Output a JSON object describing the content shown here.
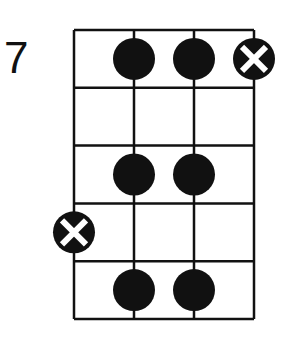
{
  "diagram": {
    "type": "bass-fretboard",
    "start_fret_label": "7",
    "strings": 4,
    "frets": 5,
    "grid": {
      "left": 74,
      "right": 254,
      "top": 30,
      "bottom": 319
    },
    "colors": {
      "line": "#111111",
      "dot": "#111111",
      "background": "#ffffff",
      "x_mark": "#ffffff"
    },
    "notes": [
      {
        "fret": 1,
        "string": 2,
        "type": "dot"
      },
      {
        "fret": 1,
        "string": 3,
        "type": "dot"
      },
      {
        "fret": 1,
        "string": 4,
        "type": "x-dot"
      },
      {
        "fret": 3,
        "string": 2,
        "type": "dot"
      },
      {
        "fret": 3,
        "string": 3,
        "type": "dot"
      },
      {
        "fret": 4,
        "string": 1,
        "type": "x-dot"
      },
      {
        "fret": 5,
        "string": 2,
        "type": "dot"
      },
      {
        "fret": 5,
        "string": 3,
        "type": "dot"
      }
    ]
  }
}
